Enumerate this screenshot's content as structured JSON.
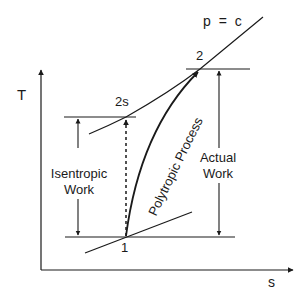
{
  "diagram": {
    "type": "T-s diagram",
    "axes": {
      "y_label": "T",
      "x_label": "s"
    },
    "isobar_label": "p = c",
    "points": {
      "p1": "1",
      "p2s": "2s",
      "p2": "2"
    },
    "process_label": "Polytropic Process",
    "isentropic_work": {
      "line1": "Isentropic",
      "line2": "Work"
    },
    "actual_work": {
      "line1": "Actual",
      "line2": "Work"
    },
    "colors": {
      "line": "#1a1a1a",
      "background": "#ffffff"
    }
  }
}
